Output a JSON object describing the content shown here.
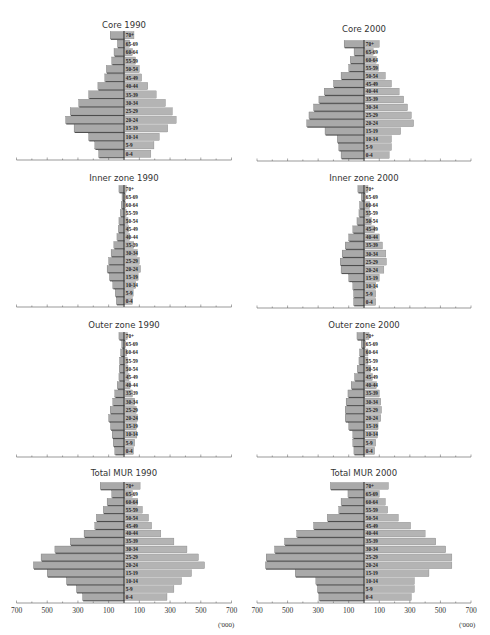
{
  "figure": {
    "unit_label": "('000)",
    "axis_tick_labels": [
      "700",
      "500",
      "300",
      "100",
      "100",
      "300",
      "500",
      "700"
    ]
  },
  "age_groups": [
    "0-4",
    "5-9",
    "10-14",
    "15-19",
    "20-24",
    "25-29",
    "30-34",
    "35-39",
    "40-44",
    "45-49",
    "50-54",
    "55-59",
    "60-64",
    "65-69",
    "70+"
  ],
  "colors": {
    "bar_left": "#a9a9a9",
    "bar_right": "#b4b4b4",
    "bar_shadow": "#3a3a3a",
    "axis": "#555555"
  },
  "chart_data": [
    {
      "type": "bar",
      "orientation": "horizontal-population-pyramid",
      "title": "Core 1990",
      "categories": [
        "0-4",
        "5-9",
        "10-14",
        "15-19",
        "20-24",
        "25-29",
        "30-34",
        "35-39",
        "40-44",
        "45-49",
        "50-54",
        "55-59",
        "60-64",
        "65-69",
        "70+"
      ],
      "series": [
        {
          "name": "left",
          "values": [
            165,
            190,
            230,
            325,
            380,
            350,
            295,
            230,
            170,
            125,
            115,
            80,
            65,
            43,
            90
          ]
        },
        {
          "name": "right",
          "values": [
            175,
            195,
            230,
            285,
            340,
            315,
            270,
            210,
            155,
            115,
            100,
            75,
            55,
            37,
            65
          ]
        }
      ],
      "xlabel": "('000)",
      "xlim": [
        -700,
        700
      ]
    },
    {
      "type": "bar",
      "orientation": "horizontal-population-pyramid",
      "title": "Core 2000",
      "categories": [
        "0-4",
        "5-9",
        "10-14",
        "15-19",
        "20-24",
        "25-29",
        "30-34",
        "35-39",
        "40-44",
        "45-49",
        "50-54",
        "55-59",
        "60-64",
        "65-69",
        "70+"
      ],
      "series": [
        {
          "name": "left",
          "values": [
            150,
            165,
            175,
            255,
            375,
            360,
            330,
            295,
            260,
            200,
            150,
            100,
            90,
            65,
            130
          ]
        },
        {
          "name": "right",
          "values": [
            165,
            180,
            180,
            240,
            325,
            310,
            285,
            260,
            230,
            180,
            140,
            95,
            80,
            60,
            100
          ]
        }
      ],
      "xlabel": "('000)",
      "xlim": [
        -700,
        700
      ]
    },
    {
      "type": "bar",
      "orientation": "horizontal-population-pyramid",
      "title": "Inner zone 1990",
      "categories": [
        "0-4",
        "5-9",
        "10-14",
        "15-19",
        "20-24",
        "25-29",
        "30-34",
        "35-39",
        "40-44",
        "45-49",
        "50-54",
        "55-59",
        "60-64",
        "65-69",
        "70+"
      ],
      "series": [
        {
          "name": "left",
          "values": [
            50,
            57,
            73,
            95,
            110,
            100,
            84,
            66,
            46,
            37,
            33,
            24,
            18,
            13,
            33
          ]
        },
        {
          "name": "right",
          "values": [
            55,
            60,
            77,
            92,
            108,
            100,
            86,
            64,
            37,
            30,
            26,
            15,
            11,
            11,
            15
          ]
        }
      ],
      "xlabel": "('000)",
      "xlim": [
        -700,
        700
      ]
    },
    {
      "type": "bar",
      "orientation": "horizontal-population-pyramid",
      "title": "Inner zone 2000",
      "categories": [
        "0-4",
        "5-9",
        "10-14",
        "15-19",
        "20-24",
        "25-29",
        "30-34",
        "35-39",
        "40-44",
        "45-49",
        "50-54",
        "55-59",
        "60-64",
        "65-69",
        "70+"
      ],
      "series": [
        {
          "name": "left",
          "values": [
            68,
            68,
            73,
            100,
            150,
            156,
            143,
            123,
            100,
            73,
            46,
            33,
            29,
            18,
            40
          ]
        },
        {
          "name": "right",
          "values": [
            77,
            77,
            77,
            100,
            130,
            147,
            143,
            121,
            100,
            70,
            48,
            37,
            37,
            11,
            26
          ]
        }
      ],
      "xlabel": "('000)",
      "xlim": [
        -700,
        700
      ]
    },
    {
      "type": "bar",
      "orientation": "horizontal-population-pyramid",
      "title": "Outer zone 1990",
      "categories": [
        "0-4",
        "5-9",
        "10-14",
        "15-19",
        "20-24",
        "25-29",
        "30-34",
        "35-39",
        "40-44",
        "45-49",
        "50-54",
        "55-59",
        "60-64",
        "65-69",
        "70+"
      ],
      "series": [
        {
          "name": "left",
          "values": [
            60,
            70,
            77,
            88,
            100,
            90,
            73,
            60,
            44,
            33,
            31,
            29,
            22,
            15,
            33
          ]
        },
        {
          "name": "right",
          "values": [
            62,
            70,
            84,
            80,
            88,
            80,
            70,
            55,
            40,
            33,
            26,
            22,
            18,
            11,
            22
          ]
        }
      ],
      "xlabel": "('000)",
      "xlim": [
        -700,
        700
      ]
    },
    {
      "type": "bar",
      "orientation": "horizontal-population-pyramid",
      "title": "Outer zone 2000",
      "categories": [
        "0-4",
        "5-9",
        "10-14",
        "15-19",
        "20-24",
        "25-29",
        "30-34",
        "35-39",
        "40-44",
        "45-49",
        "50-54",
        "55-59",
        "60-64",
        "65-69",
        "70+"
      ],
      "series": [
        {
          "name": "left",
          "values": [
            66,
            73,
            73,
            100,
            123,
            123,
            117,
            105,
            84,
            62,
            44,
            33,
            29,
            18,
            46
          ]
        },
        {
          "name": "right",
          "values": [
            70,
            77,
            88,
            92,
            110,
            115,
            110,
            100,
            81,
            55,
            44,
            26,
            26,
            11,
            33
          ]
        }
      ],
      "xlabel": "('000)",
      "xlim": [
        -700,
        700
      ]
    },
    {
      "type": "bar",
      "orientation": "horizontal-population-pyramid",
      "title": "Total MUR 1990",
      "categories": [
        "0-4",
        "5-9",
        "10-14",
        "15-19",
        "20-24",
        "25-29",
        "30-34",
        "35-39",
        "40-44",
        "45-49",
        "50-54",
        "55-59",
        "60-64",
        "65-69",
        "70+"
      ],
      "series": [
        {
          "name": "left",
          "values": [
            270,
            310,
            375,
            500,
            590,
            540,
            450,
            350,
            260,
            190,
            180,
            135,
            110,
            80,
            155
          ]
        },
        {
          "name": "right",
          "values": [
            280,
            325,
            375,
            440,
            525,
            485,
            410,
            325,
            240,
            180,
            160,
            120,
            90,
            55,
            105
          ]
        }
      ],
      "xlabel": "('000)",
      "xlim": [
        -700,
        700
      ],
      "xticklabels": [
        "700",
        "500",
        "300",
        "100",
        "100",
        "300",
        "500",
        "700"
      ]
    },
    {
      "type": "bar",
      "orientation": "horizontal-population-pyramid",
      "title": "Total MUR 2000",
      "categories": [
        "0-4",
        "5-9",
        "10-14",
        "15-19",
        "20-24",
        "25-29",
        "30-34",
        "35-39",
        "40-44",
        "45-49",
        "50-54",
        "55-59",
        "60-64",
        "65-69",
        "70+"
      ],
      "series": [
        {
          "name": "left",
          "values": [
            295,
            305,
            315,
            450,
            645,
            640,
            585,
            520,
            440,
            330,
            240,
            165,
            150,
            105,
            220
          ]
        },
        {
          "name": "right",
          "values": [
            310,
            330,
            330,
            425,
            575,
            575,
            535,
            470,
            400,
            305,
            225,
            155,
            140,
            100,
            160
          ]
        }
      ],
      "xlabel": "('000)",
      "xlim": [
        -700,
        700
      ],
      "xticklabels": [
        "700",
        "500",
        "300",
        "100",
        "100",
        "300",
        "500",
        "700"
      ]
    }
  ]
}
